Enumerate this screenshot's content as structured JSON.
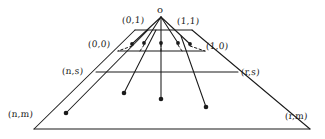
{
  "figure": {
    "type": "diagram",
    "background_color": "#ffffff",
    "stroke_color": "#1a1a1a",
    "apex": {
      "label": "o",
      "x": 161,
      "y": 14
    },
    "labels": [
      {
        "id": "apex",
        "text": "o",
        "x": 157,
        "y": 5,
        "cls": "apex"
      },
      {
        "id": "zero-one",
        "text": "(0,1)",
        "x": 122,
        "y": 16,
        "cls": ""
      },
      {
        "id": "one-one",
        "text": "(1,1)",
        "x": 177,
        "y": 17,
        "cls": ""
      },
      {
        "id": "zero-zero",
        "text": "(0,0)",
        "x": 88,
        "y": 40,
        "cls": ""
      },
      {
        "id": "one-zero",
        "text": "(1,0)",
        "x": 206,
        "y": 42,
        "cls": ""
      },
      {
        "id": "n-s",
        "text": "(n,s)",
        "x": 62,
        "y": 67,
        "cls": ""
      },
      {
        "id": "r-s",
        "text": "(r,s)",
        "x": 241,
        "y": 68,
        "cls": ""
      },
      {
        "id": "n-m",
        "text": "(n,m)",
        "x": 8,
        "y": 110,
        "cls": ""
      },
      {
        "id": "r-m",
        "text": "(r,m)",
        "x": 285,
        "y": 112,
        "cls": ""
      }
    ],
    "vertices": {
      "outer_trapezoid": {
        "top_left": {
          "x": 96,
          "y": 72
        },
        "top_right": {
          "x": 238,
          "y": 72
        },
        "bottom_right": {
          "x": 310,
          "y": 129
        },
        "bottom_left": {
          "x": 34,
          "y": 129
        }
      },
      "inner_trapezoid": {
        "top_left": {
          "x": 135,
          "y": 30
        },
        "top_right": {
          "x": 192,
          "y": 30
        },
        "bottom_right": {
          "x": 205,
          "y": 51
        },
        "bottom_left": {
          "x": 118,
          "y": 51
        }
      }
    },
    "solid_lines": [
      {
        "id": "outer-base",
        "x1": 34,
        "y1": 129,
        "x2": 310,
        "y2": 129
      },
      {
        "id": "outer-left-side",
        "x1": 34,
        "y1": 129,
        "x2": 135,
        "y2": 30
      },
      {
        "id": "outer-right-side",
        "x1": 310,
        "y1": 129,
        "x2": 192,
        "y2": 30
      },
      {
        "id": "s-level-line",
        "x1": 96,
        "y1": 72,
        "x2": 238,
        "y2": 72
      },
      {
        "id": "zero-level-line",
        "x1": 118,
        "y1": 51,
        "x2": 205,
        "y2": 51
      },
      {
        "id": "inner-top-line",
        "x1": 135,
        "y1": 30,
        "x2": 192,
        "y2": 30
      },
      {
        "id": "apex-ray-far-left",
        "x1": 161,
        "y1": 17,
        "x2": 132,
        "y2": 44
      },
      {
        "id": "apex-ray-left",
        "x1": 161,
        "y1": 17,
        "x2": 144,
        "y2": 43
      },
      {
        "id": "apex-ray-right",
        "x1": 161,
        "y1": 17,
        "x2": 178,
        "y2": 43
      },
      {
        "id": "apex-ray-far-right",
        "x1": 161,
        "y1": 17,
        "x2": 190,
        "y2": 44
      },
      {
        "id": "apex-vertical",
        "x1": 161,
        "y1": 17,
        "x2": 161,
        "y2": 99
      },
      {
        "id": "deep-ray-left",
        "x1": 148,
        "y1": 30,
        "x2": 66,
        "y2": 113
      },
      {
        "id": "deep-ray-midleft",
        "x1": 156,
        "y1": 30,
        "x2": 124,
        "y2": 93
      },
      {
        "id": "deep-ray-right",
        "x1": 181,
        "y1": 36,
        "x2": 206,
        "y2": 107
      }
    ],
    "dashed_lines": [
      {
        "id": "dash-far-left",
        "x1": 132,
        "y1": 46,
        "x2": 118,
        "y2": 51
      },
      {
        "id": "dash-left",
        "x1": 144,
        "y1": 45,
        "x2": 140,
        "y2": 51
      },
      {
        "id": "dash-center",
        "x1": 161,
        "y1": 44,
        "x2": 161,
        "y2": 51
      },
      {
        "id": "dash-right",
        "x1": 178,
        "y1": 45,
        "x2": 182,
        "y2": 51
      },
      {
        "id": "dash-far-right",
        "x1": 190,
        "y1": 46,
        "x2": 205,
        "y2": 51
      }
    ],
    "dots": [
      {
        "id": "dot-ray-far-left",
        "x": 132,
        "y": 44,
        "r": 1.9
      },
      {
        "id": "dot-ray-left",
        "x": 144,
        "y": 43,
        "r": 1.9
      },
      {
        "id": "dot-ray-center",
        "x": 161,
        "y": 43,
        "r": 1.9
      },
      {
        "id": "dot-ray-right",
        "x": 178,
        "y": 43,
        "r": 1.9
      },
      {
        "id": "dot-ray-far-right",
        "x": 190,
        "y": 44,
        "r": 1.9
      },
      {
        "id": "dot-deep-left",
        "x": 66,
        "y": 113,
        "r": 2.3
      },
      {
        "id": "dot-deep-midleft",
        "x": 124,
        "y": 93,
        "r": 2.3
      },
      {
        "id": "dot-deep-center",
        "x": 161,
        "y": 99,
        "r": 2.3
      },
      {
        "id": "dot-deep-right",
        "x": 206,
        "y": 107,
        "r": 2.3
      }
    ]
  }
}
